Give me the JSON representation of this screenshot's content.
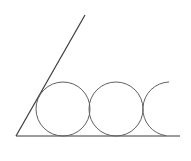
{
  "diagram": {
    "colors": {
      "background": "#ffffff",
      "lines": "#3a3a3a",
      "circles": "#606060"
    },
    "vertex": {
      "x": 16,
      "y": 136
    },
    "ray": {
      "x1": 16,
      "y1": 136,
      "x2": 85,
      "y2": 15
    },
    "baseline": {
      "x1": 16,
      "y1": 136,
      "x2": 180,
      "y2": 136
    },
    "circles": [
      {
        "cx": 63,
        "cy": 109,
        "r": 27,
        "type": "full"
      },
      {
        "cx": 116,
        "cy": 109,
        "r": 27,
        "type": "full"
      },
      {
        "cx": 170,
        "cy": 109,
        "r": 27,
        "type": "partial-left-arc"
      }
    ]
  }
}
